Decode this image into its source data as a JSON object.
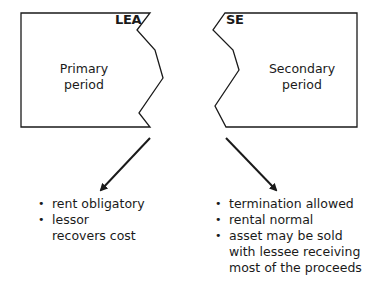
{
  "left_box": {
    "tag": "LEA",
    "title_line1": "Primary",
    "title_line2": "period",
    "bullets": [
      "rent obligatory",
      "lessor recovers cost"
    ]
  },
  "right_box": {
    "tag": "SE",
    "title_line1": "Secondary",
    "title_line2": "period",
    "bullets": [
      "termination allowed",
      "rental normal",
      "asset may be sold with lessee receiving most of the proceeds"
    ]
  },
  "colors": {
    "stroke": "#1a1a1a",
    "background": "#ffffff"
  }
}
